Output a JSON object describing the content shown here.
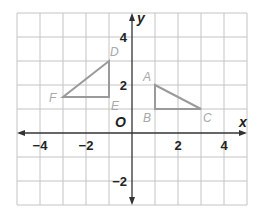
{
  "chart_data": {
    "type": "scatter",
    "title": "",
    "xlabel": "x",
    "ylabel": "y",
    "xlim": [
      -5,
      5
    ],
    "ylim": [
      -3,
      5
    ],
    "grid": true,
    "xticks": [
      -4,
      -2,
      2,
      4
    ],
    "xtick_labels": [
      "−4",
      "−2",
      "2",
      "4"
    ],
    "yticks": [
      4,
      2,
      -2
    ],
    "ytick_labels": [
      "4",
      "2",
      "−2"
    ],
    "origin_label": "O",
    "series": [
      {
        "name": "Triangle ABC",
        "shape": "polygon",
        "points": [
          {
            "label": "A",
            "x": 1,
            "y": 2
          },
          {
            "label": "B",
            "x": 1,
            "y": 1
          },
          {
            "label": "C",
            "x": 3,
            "y": 1
          }
        ]
      },
      {
        "name": "Triangle DEF",
        "shape": "polygon",
        "points": [
          {
            "label": "D",
            "x": -1,
            "y": 3
          },
          {
            "label": "E",
            "x": -1,
            "y": 1.5
          },
          {
            "label": "F",
            "x": -3,
            "y": 1.5
          }
        ]
      }
    ],
    "colors": {
      "grid": "#c4c4c4",
      "axes": "#333333",
      "shapes": "#9a9a9a",
      "point_labels": "#a8a8a8"
    }
  }
}
